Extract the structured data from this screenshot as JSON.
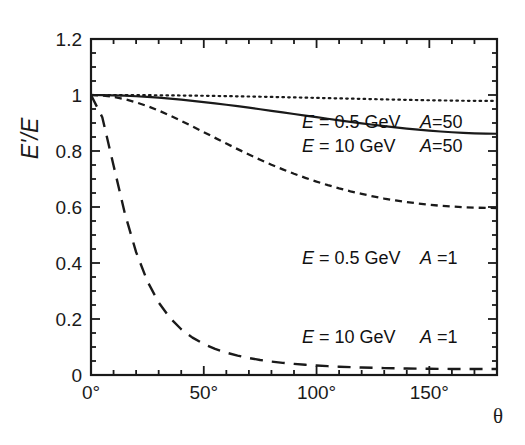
{
  "figure": {
    "background_color": "#ffffff",
    "line_color": "#1a1a1a",
    "xlabel": "θ",
    "ylabel": "E'/E"
  },
  "axes": {
    "x_ticks_major": [
      "0°",
      "50°",
      "100°",
      "150°"
    ],
    "x_tick_values": [
      0,
      50,
      100,
      150
    ],
    "y_ticks_major": [
      "0",
      "0.2",
      "0.4",
      "0.6",
      "0.8",
      "1",
      "1.2"
    ],
    "y_tick_values": [
      0,
      0.2,
      0.4,
      0.6,
      0.8,
      1,
      1.2
    ],
    "x_minor_step": 10,
    "y_minor_step": 0.05
  },
  "annotations": [
    {
      "id": "annot-dotted",
      "energy": "E = 0.5 GeV",
      "mass": "A=50",
      "left": 302,
      "top": 113
    },
    {
      "id": "annot-solid",
      "energy": "E = 10 GeV",
      "mass": "A=50",
      "left": 302,
      "top": 137
    },
    {
      "id": "annot-shortdash",
      "energy": "E = 0.5 GeV",
      "mass": "A =1",
      "left": 302,
      "top": 249
    },
    {
      "id": "annot-longdash",
      "energy": "E = 10 GeV",
      "mass": "A =1",
      "left": 302,
      "top": 328
    }
  ],
  "chart_data": {
    "type": "line",
    "title": "",
    "xlabel": "θ",
    "ylabel": "E'/E",
    "xlim": [
      0,
      180
    ],
    "ylim": [
      0,
      1.2
    ],
    "grid": false,
    "legend": "inline-annotations",
    "x": [
      0,
      5,
      10,
      15,
      20,
      25,
      30,
      35,
      40,
      45,
      50,
      55,
      60,
      65,
      70,
      75,
      80,
      85,
      90,
      95,
      100,
      105,
      110,
      115,
      120,
      125,
      130,
      135,
      140,
      145,
      150,
      155,
      160,
      165,
      170,
      175,
      180
    ],
    "series": [
      {
        "name": "E = 0.5 GeV, A=50",
        "style": "dotted",
        "values": [
          1.0,
          1.0,
          0.9999,
          0.9997,
          0.9995,
          0.9993,
          0.999,
          0.9986,
          0.9982,
          0.9977,
          0.9972,
          0.9966,
          0.996,
          0.9953,
          0.9946,
          0.9938,
          0.9931,
          0.9923,
          0.9914,
          0.9906,
          0.9897,
          0.9888,
          0.9879,
          0.987,
          0.9861,
          0.9852,
          0.9843,
          0.9835,
          0.9827,
          0.9819,
          0.9812,
          0.9806,
          0.98,
          0.9795,
          0.9791,
          0.9789,
          0.9788
        ]
      },
      {
        "name": "E = 10 GeV, A=50",
        "style": "solid",
        "values": [
          1.0,
          0.9997,
          0.9989,
          0.9975,
          0.9956,
          0.9932,
          0.9903,
          0.987,
          0.9833,
          0.9792,
          0.9748,
          0.9701,
          0.9652,
          0.96,
          0.9547,
          0.9492,
          0.9436,
          0.9379,
          0.9322,
          0.9265,
          0.9208,
          0.9151,
          0.9096,
          0.9042,
          0.8989,
          0.8938,
          0.889,
          0.8845,
          0.8802,
          0.8763,
          0.8728,
          0.8697,
          0.867,
          0.8648,
          0.8631,
          0.862,
          0.8616
        ]
      },
      {
        "name": "E = 0.5 GeV, A=1",
        "style": "short-dash",
        "values": [
          1.0,
          0.9983,
          0.9933,
          0.9851,
          0.974,
          0.9603,
          0.9444,
          0.9267,
          0.9077,
          0.8878,
          0.8674,
          0.8469,
          0.8266,
          0.8066,
          0.7873,
          0.7688,
          0.7511,
          0.7345,
          0.7188,
          0.7042,
          0.6906,
          0.6781,
          0.6666,
          0.6561,
          0.6466,
          0.638,
          0.6303,
          0.6235,
          0.6176,
          0.6125,
          0.6081,
          0.6045,
          0.6016,
          0.5993,
          0.5977,
          0.5967,
          0.5963
        ]
      },
      {
        "name": "E = 10 GeV, A=1",
        "style": "long-dash",
        "values": [
          1.0,
          0.9205,
          0.7484,
          0.5773,
          0.4386,
          0.3346,
          0.2588,
          0.2037,
          0.1634,
          0.1334,
          0.1107,
          0.0933,
          0.0798,
          0.0691,
          0.0606,
          0.0537,
          0.0481,
          0.0435,
          0.0397,
          0.0365,
          0.0338,
          0.0316,
          0.0297,
          0.0281,
          0.0267,
          0.0256,
          0.0246,
          0.0238,
          0.0232,
          0.0226,
          0.0222,
          0.0219,
          0.0216,
          0.0215,
          0.0214,
          0.0213,
          0.0213
        ]
      }
    ],
    "plot_box_px": {
      "left": 91,
      "top": 39,
      "right": 497,
      "bottom": 375
    }
  }
}
